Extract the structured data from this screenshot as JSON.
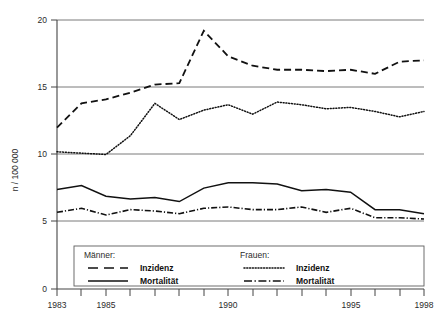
{
  "chart_data": {
    "type": "line",
    "title": "",
    "subtitle": "",
    "xlabel": "",
    "ylabel": "n / 100 000",
    "xlim": [
      1983,
      1998
    ],
    "ylim": [
      0,
      20
    ],
    "grid": "horizontal",
    "x_tick_labels": [
      "1983",
      "1985",
      "1990",
      "1995",
      "1998"
    ],
    "x_tick_values": [
      1983,
      1985,
      1990,
      1995,
      1998
    ],
    "x_minor_ticks": [
      1984,
      1986,
      1987,
      1988,
      1989,
      1991,
      1992,
      1993,
      1994,
      1996,
      1997
    ],
    "y_tick_labels": [
      "0",
      "5",
      "10",
      "15",
      "20"
    ],
    "y_tick_values": [
      0,
      5,
      10,
      15,
      20
    ],
    "gridline_values": [
      5,
      10,
      15,
      20
    ],
    "legend_position": "bottom-inside",
    "x": [
      1983,
      1984,
      1985,
      1986,
      1987,
      1988,
      1989,
      1990,
      1991,
      1992,
      1993,
      1994,
      1995,
      1996,
      1997,
      1998
    ],
    "series": [
      {
        "name": "Männer: Inzidenz",
        "group": "Männer",
        "measure": "Inzidenz",
        "style": "dashed",
        "color": "#111111",
        "values": [
          12.0,
          13.8,
          14.1,
          14.6,
          15.2,
          15.3,
          19.2,
          17.3,
          16.6,
          16.3,
          16.3,
          16.2,
          16.3,
          16.0,
          16.9,
          17.0
        ]
      },
      {
        "name": "Frauen: Inzidenz",
        "group": "Frauen",
        "measure": "Inzidenz",
        "style": "dotted",
        "color": "#111111",
        "values": [
          10.2,
          10.1,
          10.0,
          11.4,
          13.8,
          12.6,
          13.3,
          13.7,
          13.0,
          13.9,
          13.7,
          13.4,
          13.5,
          13.2,
          12.8,
          13.2
        ]
      },
      {
        "name": "Männer: Mortalität",
        "group": "Männer",
        "measure": "Mortalität",
        "style": "solid",
        "color": "#111111",
        "values": [
          7.4,
          7.7,
          6.9,
          6.7,
          6.8,
          6.5,
          7.5,
          7.9,
          7.9,
          7.8,
          7.3,
          7.4,
          7.2,
          5.9,
          5.9,
          5.6
        ]
      },
      {
        "name": "Frauen: Mortalität",
        "group": "Frauen",
        "measure": "Mortalität",
        "style": "dash-dot",
        "color": "#111111",
        "values": [
          5.7,
          6.0,
          5.5,
          5.9,
          5.8,
          5.6,
          6.0,
          6.1,
          5.9,
          5.9,
          6.1,
          5.7,
          6.0,
          5.3,
          5.3,
          5.2
        ]
      }
    ]
  },
  "axes": {
    "y_axis_title": "n / 100 000",
    "y_ticks": [
      "0",
      "5",
      "10",
      "15",
      "20"
    ],
    "x_ticks": [
      "1983",
      "1985",
      "1990",
      "1995",
      "1998"
    ]
  },
  "legend": {
    "groups": [
      {
        "title": "Männer:",
        "entries": [
          {
            "label": "Inzidenz",
            "style": "dashed"
          },
          {
            "label": "Mortalität",
            "style": "solid"
          }
        ]
      },
      {
        "title": "Frauen:",
        "entries": [
          {
            "label": "Inzidenz",
            "style": "dotted"
          },
          {
            "label": "Mortalität",
            "style": "dash-dot"
          }
        ]
      }
    ]
  }
}
